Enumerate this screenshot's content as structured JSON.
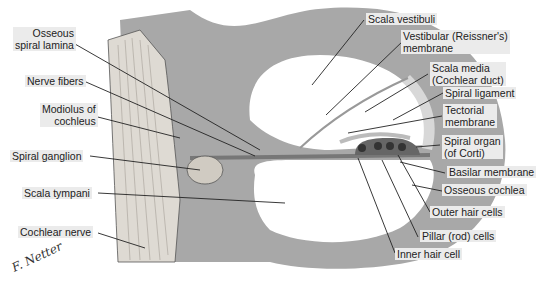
{
  "figure": {
    "colors": {
      "bone": "#a8a8a8",
      "cavity": "#ffffff",
      "nerve": "#dedad3",
      "leader": "#222222"
    }
  },
  "labels_left": [
    {
      "id": "osseous-spiral-lamina",
      "lines": [
        "Osseous",
        "spiral lamina"
      ]
    },
    {
      "id": "nerve-fibers",
      "lines": [
        "Nerve fibers"
      ]
    },
    {
      "id": "modiolus-of-cochleus",
      "lines": [
        "Modiolus of",
        "cochleus"
      ]
    },
    {
      "id": "spiral-ganglion",
      "lines": [
        "Spiral ganglion"
      ]
    },
    {
      "id": "scala-tympani",
      "lines": [
        "Scala tympani"
      ]
    },
    {
      "id": "cochlear-nerve",
      "lines": [
        "Cochlear nerve"
      ]
    }
  ],
  "labels_right": [
    {
      "id": "scala-vestibuli",
      "lines": [
        "Scala vestibuli"
      ]
    },
    {
      "id": "vestibular-membrane",
      "lines": [
        "Vestibular (Reissner's)",
        "membrane"
      ]
    },
    {
      "id": "scala-media",
      "lines": [
        "Scala media",
        "(Cochlear duct)"
      ]
    },
    {
      "id": "spiral-ligament",
      "lines": [
        "Spiral ligament"
      ]
    },
    {
      "id": "tectorial-membrane",
      "lines": [
        "Tectorial",
        "membrane"
      ]
    },
    {
      "id": "spiral-organ",
      "lines": [
        "Spiral organ",
        "(of Corti)"
      ]
    },
    {
      "id": "basilar-membrane",
      "lines": [
        "Basilar membrane"
      ]
    },
    {
      "id": "osseous-cochlea",
      "lines": [
        "Osseous cochlea"
      ]
    },
    {
      "id": "outer-hair-cells",
      "lines": [
        "Outer hair cells"
      ]
    },
    {
      "id": "pillar-rod-cells",
      "lines": [
        "Pillar (rod) cells"
      ]
    },
    {
      "id": "inner-hair-cell",
      "lines": [
        "Inner hair cell"
      ]
    }
  ],
  "signature": "F. Netter"
}
